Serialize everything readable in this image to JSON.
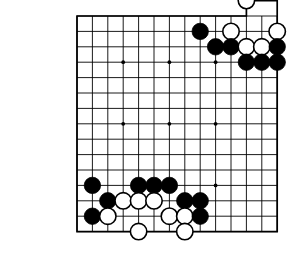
{
  "diagram": {
    "kind": "go-board-diagram",
    "labels": [
      {
        "text": "105",
        "x": 12,
        "y": 46
      },
      {
        "text": "106",
        "x": 12,
        "y": 161
      }
    ],
    "board": {
      "origin_x": 77,
      "origin_y": 16,
      "cell": 15.4,
      "cols": 13,
      "rows": 14,
      "stone_radius": 8.2,
      "line_color": "#000000",
      "border_color": "#000000",
      "background": "#ffffff",
      "notch": {
        "present": true,
        "description": "top-right corner border steps outward around an off-edge white stone"
      },
      "star_points": [
        {
          "col": 3,
          "row": 3
        },
        {
          "col": 6,
          "row": 3
        },
        {
          "col": 9,
          "row": 3
        },
        {
          "col": 3,
          "row": 7
        },
        {
          "col": 6,
          "row": 7
        },
        {
          "col": 9,
          "row": 7
        },
        {
          "col": 6,
          "row": 11
        },
        {
          "col": 9,
          "row": 11
        }
      ]
    },
    "stones": [
      {
        "color": "white",
        "col": 11,
        "row": -1
      },
      {
        "color": "black",
        "col": 8,
        "row": 1
      },
      {
        "color": "white",
        "col": 10,
        "row": 1
      },
      {
        "color": "white",
        "col": 13,
        "row": 1
      },
      {
        "color": "black",
        "col": 9,
        "row": 2
      },
      {
        "color": "black",
        "col": 10,
        "row": 2
      },
      {
        "color": "white",
        "col": 11,
        "row": 2
      },
      {
        "color": "white",
        "col": 12,
        "row": 2
      },
      {
        "color": "black",
        "col": 13,
        "row": 2
      },
      {
        "color": "black",
        "col": 11,
        "row": 3
      },
      {
        "color": "black",
        "col": 12,
        "row": 3
      },
      {
        "color": "black",
        "col": 13,
        "row": 3
      },
      {
        "color": "black",
        "col": 1,
        "row": 11
      },
      {
        "color": "black",
        "col": 4,
        "row": 11
      },
      {
        "color": "black",
        "col": 5,
        "row": 11
      },
      {
        "color": "black",
        "col": 6,
        "row": 11
      },
      {
        "color": "black",
        "col": 2,
        "row": 12
      },
      {
        "color": "white",
        "col": 3,
        "row": 12
      },
      {
        "color": "white",
        "col": 4,
        "row": 12
      },
      {
        "color": "white",
        "col": 5,
        "row": 12
      },
      {
        "color": "black",
        "col": 7,
        "row": 12
      },
      {
        "color": "black",
        "col": 8,
        "row": 12
      },
      {
        "color": "black",
        "col": 1,
        "row": 13
      },
      {
        "color": "white",
        "col": 2,
        "row": 13
      },
      {
        "color": "white",
        "col": 6,
        "row": 13
      },
      {
        "color": "white",
        "col": 7,
        "row": 13
      },
      {
        "color": "black",
        "col": 8,
        "row": 13
      },
      {
        "color": "white",
        "col": 4,
        "row": 14
      },
      {
        "color": "white",
        "col": 7,
        "row": 14
      }
    ]
  }
}
